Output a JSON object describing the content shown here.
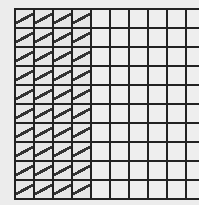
{
  "grid": {
    "rows": 10,
    "cols": 10,
    "shaded_columns": 4,
    "shaded_cells": 40,
    "total_cells": 100,
    "line_color": "#222222",
    "cell_color": "#eeeeee",
    "hatch_color": "#333333"
  }
}
